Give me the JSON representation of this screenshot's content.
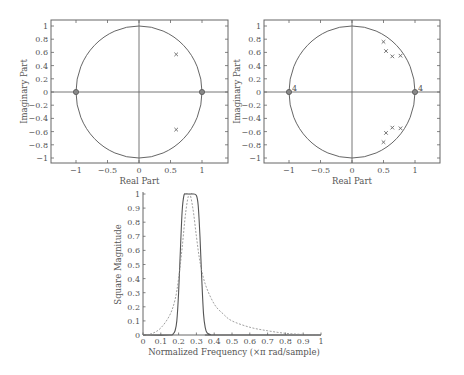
{
  "chart_data": [
    {
      "type": "scatter",
      "title": "",
      "xlabel": "Real Part",
      "ylabel": "Imaginary Part",
      "xlim": [
        -1.4,
        1.4
      ],
      "ylim": [
        -1.1,
        1.1
      ],
      "xticks": [
        "-1",
        "-0.5",
        "0",
        "0.5",
        "1"
      ],
      "yticks": [
        "1",
        "0.8",
        "0.6",
        "0.4",
        "0.2",
        "0",
        "-0.2",
        "-0.4",
        "-0.6",
        "-0.8",
        "-1"
      ],
      "unit_circle": true,
      "zeros": [
        {
          "re": -1,
          "im": 0
        },
        {
          "re": 1,
          "im": 0
        }
      ],
      "poles": [
        {
          "re": 0.59,
          "im": 0.57
        },
        {
          "re": 0.59,
          "im": -0.57
        }
      ],
      "zero_multiplicity_labels": []
    },
    {
      "type": "scatter",
      "title": "",
      "xlabel": "Real Part",
      "ylabel": "Imaginary Part",
      "xlim": [
        -1.4,
        1.4
      ],
      "ylim": [
        -1.1,
        1.1
      ],
      "xticks": [
        "-1",
        "-0.5",
        "0",
        "0.5",
        "1"
      ],
      "yticks": [
        "1",
        "0.8",
        "0.6",
        "0.4",
        "0.2",
        "0",
        "-0.2",
        "-0.4",
        "-0.6",
        "-0.8",
        "-1"
      ],
      "unit_circle": true,
      "zeros": [
        {
          "re": -1,
          "im": 0
        },
        {
          "re": 1,
          "im": 0
        }
      ],
      "zero_multiplicity_labels": [
        "4",
        "4"
      ],
      "poles": [
        {
          "re": 0.5,
          "im": 0.76
        },
        {
          "re": 0.54,
          "im": 0.62
        },
        {
          "re": 0.64,
          "im": 0.54
        },
        {
          "re": 0.77,
          "im": 0.55
        },
        {
          "re": 0.5,
          "im": -0.76
        },
        {
          "re": 0.54,
          "im": -0.62
        },
        {
          "re": 0.64,
          "im": -0.54
        },
        {
          "re": 0.77,
          "im": -0.55
        }
      ]
    },
    {
      "type": "line",
      "title": "",
      "xlabel": "Normalized Frequency (×π rad/sample)",
      "ylabel": "Square Magnitude",
      "xlim": [
        0,
        1
      ],
      "ylim": [
        0,
        1
      ],
      "xticks": [
        "0",
        "0.1",
        "0.2",
        "0.3",
        "0.4",
        "0.5",
        "0.6",
        "0.7",
        "0.8",
        "0.9",
        "1"
      ],
      "yticks": [
        "0",
        "0.1",
        "0.2",
        "0.3",
        "0.4",
        "0.5",
        "0.6",
        "0.7",
        "0.8",
        "0.9",
        "1"
      ],
      "series": [
        {
          "name": "8th-order (solid)",
          "style": "solid",
          "x": [
            0,
            0.15,
            0.17,
            0.18,
            0.19,
            0.2,
            0.21,
            0.22,
            0.23,
            0.24,
            0.26,
            0.28,
            0.3,
            0.31,
            0.32,
            0.33,
            0.34,
            0.35,
            0.36,
            0.38,
            0.4,
            1.0
          ],
          "y": [
            0,
            0,
            0.01,
            0.03,
            0.1,
            0.3,
            0.6,
            0.88,
            0.99,
            1.0,
            1.0,
            1.0,
            0.99,
            0.92,
            0.7,
            0.4,
            0.15,
            0.05,
            0.015,
            0.002,
            0,
            0
          ]
        },
        {
          "name": "2nd-order (dashed)",
          "style": "dashed",
          "x": [
            0,
            0.05,
            0.1,
            0.15,
            0.18,
            0.2,
            0.22,
            0.24,
            0.26,
            0.28,
            0.3,
            0.32,
            0.35,
            0.4,
            0.45,
            0.5,
            0.6,
            0.7,
            0.8,
            0.9,
            1.0
          ],
          "y": [
            0,
            0.01,
            0.05,
            0.14,
            0.25,
            0.4,
            0.62,
            0.87,
            1.0,
            0.9,
            0.7,
            0.52,
            0.36,
            0.22,
            0.15,
            0.1,
            0.055,
            0.03,
            0.012,
            0.004,
            0
          ]
        }
      ]
    }
  ]
}
